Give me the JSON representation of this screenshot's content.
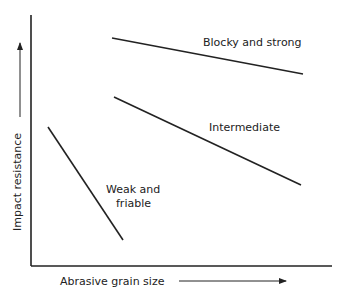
{
  "diagram": {
    "y_axis_label": "Impact resistance",
    "x_axis_label": "Abrasive grain size",
    "lines": [
      {
        "label": "Blocky and strong",
        "x1": 112,
        "y1": 38,
        "x2": 303,
        "y2": 74
      },
      {
        "label": "Intermediate",
        "x1": 114,
        "y1": 97,
        "x2": 301,
        "y2": 185
      },
      {
        "label_line1": "Weak and",
        "label_line2": "friable",
        "x1": 48,
        "y1": 127,
        "x2": 123,
        "y2": 240
      }
    ],
    "colors": {
      "ink": "#222222",
      "background": "#ffffff"
    }
  }
}
